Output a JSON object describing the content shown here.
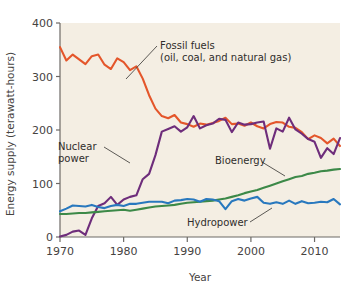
{
  "chart_data": {
    "type": "line",
    "title": "",
    "xlabel": "Year",
    "ylabel": "Energy supply (terawatt-hours)",
    "xlim": [
      1970,
      2014
    ],
    "ylim": [
      0,
      400
    ],
    "xticks": [
      "1970",
      "1980",
      "1990",
      "2000",
      "2010"
    ],
    "xtick_values": [
      1970,
      1980,
      1990,
      2000,
      2010
    ],
    "yticks": [
      "0",
      "100",
      "200",
      "300",
      "400"
    ],
    "ytick_values": [
      0,
      100,
      200,
      300,
      400
    ],
    "grid": false,
    "legend_position": "inline-annotations",
    "plot_background": "#F4EEE3",
    "x": [
      1970,
      1971,
      1972,
      1973,
      1974,
      1975,
      1976,
      1977,
      1978,
      1979,
      1980,
      1981,
      1982,
      1983,
      1984,
      1985,
      1986,
      1987,
      1988,
      1989,
      1990,
      1991,
      1992,
      1993,
      1994,
      1995,
      1996,
      1997,
      1998,
      1999,
      2000,
      2001,
      2002,
      2003,
      2004,
      2005,
      2006,
      2007,
      2008,
      2009,
      2010,
      2011,
      2012,
      2013,
      2014
    ],
    "series": [
      {
        "name": "Fossil fuels",
        "label": "Fossil fuels",
        "sublabel": "(oil, coal, and natural gas)",
        "color": "#E4562B",
        "values": [
          355,
          330,
          341,
          332,
          323,
          338,
          341,
          322,
          314,
          334,
          327,
          312,
          319,
          296,
          265,
          240,
          226,
          222,
          228,
          214,
          211,
          206,
          212,
          210,
          213,
          217,
          223,
          211,
          212,
          208,
          214,
          207,
          203,
          211,
          215,
          214,
          206,
          204,
          196,
          183,
          190,
          185,
          175,
          184,
          170
        ]
      },
      {
        "name": "Nuclear power",
        "label": "Nuclear",
        "sublabel": "power",
        "color": "#6E2D7B",
        "values": [
          1,
          4,
          10,
          12,
          4,
          35,
          58,
          63,
          75,
          60,
          70,
          75,
          78,
          108,
          118,
          153,
          197,
          202,
          207,
          197,
          205,
          226,
          203,
          209,
          212,
          221,
          219,
          196,
          214,
          210,
          211,
          214,
          216,
          165,
          203,
          197,
          223,
          201,
          193,
          183,
          178,
          148,
          166,
          155,
          185
        ]
      },
      {
        "name": "Bioenergy",
        "label": "Bioenergy",
        "sublabel": "",
        "color": "#3C8948",
        "values": [
          43,
          43,
          44,
          45,
          45,
          46,
          47,
          48,
          49,
          50,
          51,
          49,
          51,
          53,
          55,
          57,
          58,
          59,
          60,
          62,
          64,
          65,
          66,
          67,
          68,
          70,
          72,
          75,
          78,
          82,
          85,
          88,
          92,
          96,
          100,
          104,
          108,
          112,
          114,
          118,
          120,
          123,
          124,
          126,
          127
        ]
      },
      {
        "name": "Hydropower",
        "label": "Hydropower",
        "sublabel": "",
        "color": "#2878BE",
        "values": [
          48,
          53,
          59,
          58,
          57,
          60,
          56,
          54,
          58,
          60,
          58,
          62,
          62,
          64,
          66,
          66,
          66,
          63,
          68,
          69,
          71,
          70,
          66,
          71,
          70,
          67,
          52,
          67,
          71,
          68,
          72,
          75,
          64,
          62,
          65,
          62,
          68,
          62,
          67,
          63,
          64,
          66,
          65,
          71,
          61
        ]
      }
    ],
    "annotations": [
      {
        "name": "fossil-fuels",
        "line1": "Fossil fuels",
        "line2": "(oil, coal, and natural gas)"
      },
      {
        "name": "nuclear-power",
        "line1": "Nuclear",
        "line2": "power"
      },
      {
        "name": "bioenergy",
        "line1": "Bioenergy",
        "line2": ""
      },
      {
        "name": "hydropower",
        "line1": "Hydropower",
        "line2": ""
      }
    ]
  }
}
